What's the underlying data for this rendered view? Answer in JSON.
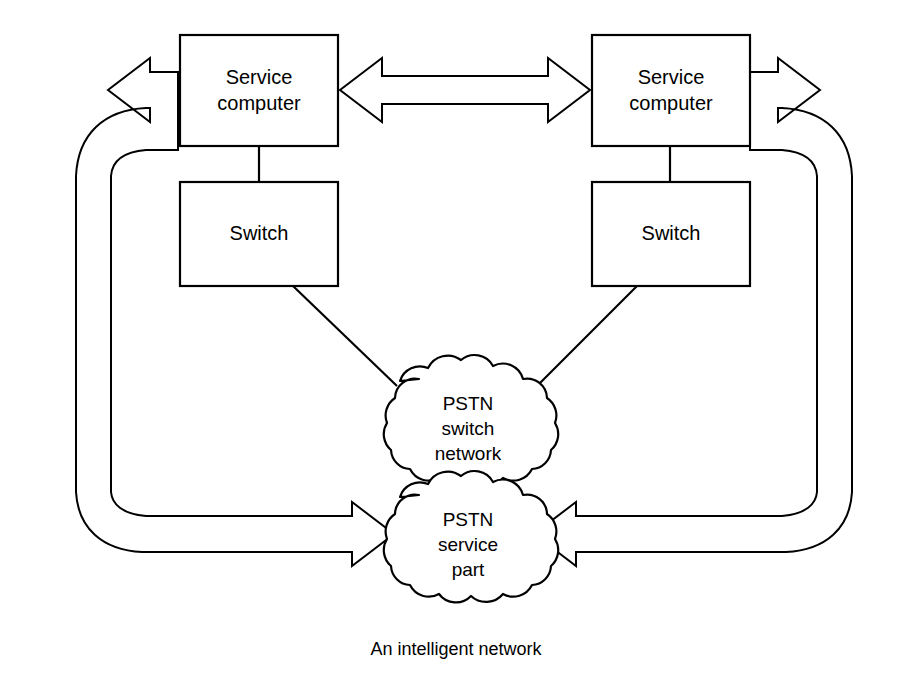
{
  "figure": {
    "caption": "An intelligent network",
    "background_color": "#ffffff",
    "line_color": "#000000"
  },
  "nodes": {
    "service_computer_left": {
      "line1": "Service",
      "line2": "computer"
    },
    "service_computer_right": {
      "line1": "Service",
      "line2": "computer"
    },
    "switch_left": {
      "label": "Switch"
    },
    "switch_right": {
      "label": "Switch"
    },
    "pstn_switch_network": {
      "line1": "PSTN",
      "line2": "switch",
      "line3": "network"
    },
    "pstn_service_part": {
      "line1": "PSTN",
      "line2": "service",
      "line3": "part"
    }
  },
  "connectors": {
    "sc_to_sc_bidirectional": "double-headed-arrow",
    "sc_left_to_switch_left": "plain-line",
    "sc_right_to_switch_right": "plain-line",
    "switch_left_to_pstn_switch": "plain-line",
    "switch_right_to_pstn_switch": "plain-line",
    "loop_left": "curved-block-arrow",
    "loop_right": "curved-block-arrow"
  }
}
